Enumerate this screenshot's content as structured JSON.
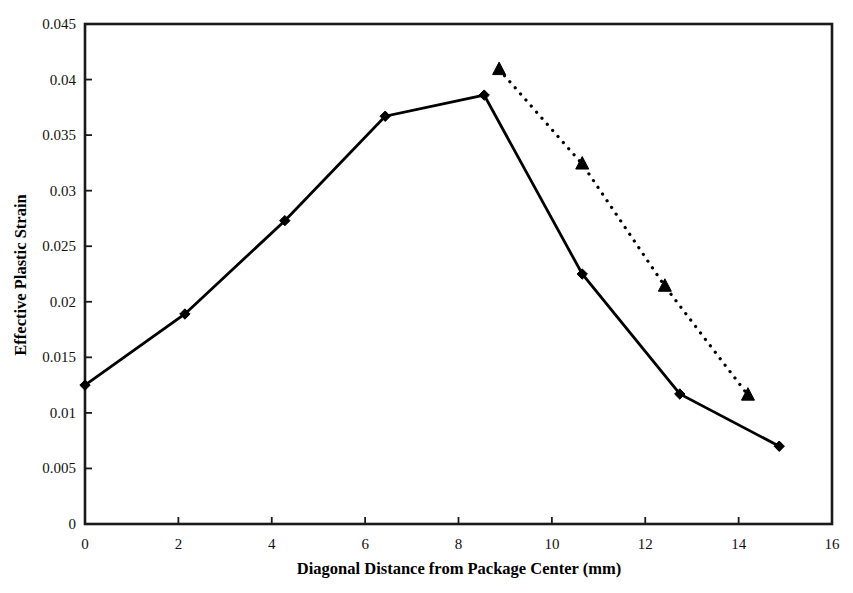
{
  "chart_data": {
    "type": "line",
    "title": "",
    "xlabel": "Diagonal Distance from Package Center (mm)",
    "ylabel": "Effective Plastic Strain",
    "xlim": [
      0,
      16
    ],
    "ylim": [
      0,
      0.045
    ],
    "xticks": [
      0,
      2,
      4,
      6,
      8,
      10,
      12,
      14,
      16
    ],
    "xtick_labels": [
      "0",
      "2",
      "4",
      "6",
      "8",
      "10",
      "12",
      "14",
      "16"
    ],
    "yticks": [
      0,
      0.005,
      0.01,
      0.015,
      0.02,
      0.025,
      0.03,
      0.035,
      0.04,
      0.045
    ],
    "ytick_labels": [
      "0",
      "0.005",
      "0.01",
      "0.015",
      "0.02",
      "0.025",
      "0.03",
      "0.035",
      "0.04",
      "0.045"
    ],
    "grid": false,
    "legend": "none",
    "frame": true,
    "series": [
      {
        "name": "solid-diamond-series",
        "marker": "diamond",
        "line_style": "solid",
        "color": "#000000",
        "x": [
          0.0,
          2.14,
          4.28,
          6.43,
          8.55,
          10.65,
          12.74,
          14.87
        ],
        "y": [
          0.0125,
          0.0189,
          0.0273,
          0.0367,
          0.0386,
          0.0225,
          0.0117,
          0.007
        ]
      },
      {
        "name": "dotted-triangle-series",
        "marker": "triangle",
        "line_style": "dotted",
        "color": "#000000",
        "x": [
          8.87,
          10.65,
          12.42,
          14.2
        ],
        "y": [
          0.0409,
          0.0324,
          0.0214,
          0.0116
        ]
      }
    ]
  },
  "axes": {
    "x_axis_name": "x-axis",
    "y_axis_name": "y-axis"
  }
}
